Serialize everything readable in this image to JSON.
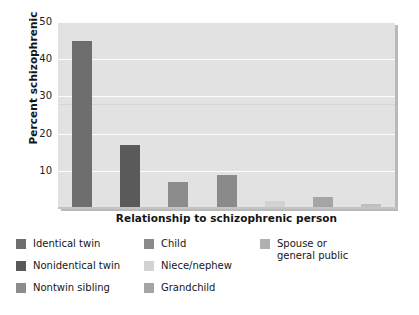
{
  "chart_data": {
    "type": "bar",
    "title": "",
    "subtitle": "",
    "xlabel": "Relationship to schizophrenic person",
    "ylabel": "Percent schizophrenic",
    "categories": [
      "Identical twin",
      "Nonidentical twin",
      "Nontwin sibling",
      "Child",
      "Niece/nephew",
      "Grandchild",
      "Spouse or general public"
    ],
    "values": [
      45,
      17,
      7,
      9,
      2,
      3,
      1
    ],
    "ylim": [
      0,
      50
    ],
    "yticks": [
      10,
      20,
      30,
      40,
      50
    ],
    "ytick_labels": [
      "10",
      "20",
      "30",
      "40",
      "50"
    ],
    "xtick_labels": [],
    "grid": "horizontal",
    "legend_position": "below",
    "bar_colors": [
      "#6e6e6e",
      "#5a5a5a",
      "#8c8c8c",
      "#8a8a8a",
      "#d2d2d2",
      "#a5a5a5",
      "#c0c0c0"
    ],
    "plot_background": "#e2e2e2",
    "gridline_color": "#fcfcfc",
    "figure_background": "#ffffff"
  },
  "axes": {
    "y_title": "Percent schizophrenic",
    "x_title": "Relationship to schizophrenic person",
    "y_ticks": [
      {
        "label": "50",
        "value": 50
      },
      {
        "label": "40",
        "value": 40
      },
      {
        "label": "30",
        "value": 30
      },
      {
        "label": "20",
        "value": 20
      },
      {
        "label": "10",
        "value": 10
      }
    ]
  },
  "legend": {
    "columns": [
      {
        "items": [
          {
            "label": "Identical twin",
            "color": "#6e6e6e"
          },
          {
            "label": "Nonidentical twin",
            "color": "#5a5a5a"
          },
          {
            "label": "Nontwin sibling",
            "color": "#8c8c8c"
          }
        ]
      },
      {
        "items": [
          {
            "label": "Child",
            "color": "#8a8a8a"
          },
          {
            "label": "Niece/nephew",
            "color": "#d2d2d2"
          },
          {
            "label": "Grandchild",
            "color": "#a5a5a5"
          }
        ]
      },
      {
        "items": [
          {
            "label": "Spouse or\ngeneral public",
            "color": "#b0b0b0"
          }
        ]
      }
    ]
  }
}
